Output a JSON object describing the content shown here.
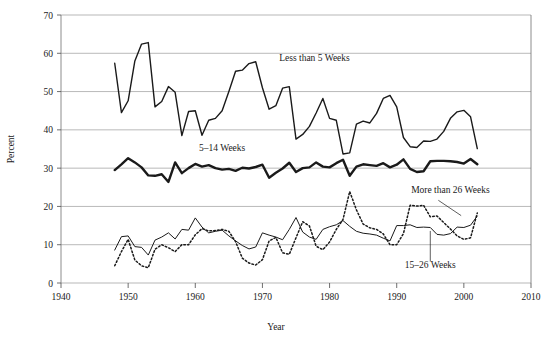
{
  "chart_data": {
    "type": "line",
    "title": "",
    "xlabel": "Year",
    "ylabel": "Percent",
    "xlim": [
      1940,
      2010
    ],
    "ylim": [
      0,
      70
    ],
    "xticks": [
      1940,
      1950,
      1960,
      1970,
      1980,
      1990,
      2000,
      2010
    ],
    "yticks": [
      0,
      10,
      20,
      30,
      40,
      50,
      60,
      70
    ],
    "grid": "horizontal",
    "legend": "inline-annotations",
    "x": [
      1948,
      1949,
      1950,
      1951,
      1952,
      1953,
      1954,
      1955,
      1956,
      1957,
      1958,
      1959,
      1960,
      1961,
      1962,
      1963,
      1964,
      1965,
      1966,
      1967,
      1968,
      1969,
      1970,
      1971,
      1972,
      1973,
      1974,
      1975,
      1976,
      1977,
      1978,
      1979,
      1980,
      1981,
      1982,
      1983,
      1984,
      1985,
      1986,
      1987,
      1988,
      1989,
      1990,
      1991,
      1992,
      1993,
      1994,
      1995,
      1996,
      1997,
      1998,
      1999,
      2000,
      2001,
      2002
    ],
    "series": [
      {
        "name": "Less than 5 Weeks",
        "style": "solid",
        "linewidth": 1.4,
        "color": "#1a1a1a",
        "values": [
          57.4,
          44.5,
          47.6,
          58.0,
          62.4,
          62.8,
          46.0,
          47.4,
          51.3,
          49.8,
          38.5,
          44.8,
          45.0,
          38.6,
          42.5,
          43.0,
          45.0,
          50.0,
          55.3,
          55.6,
          57.3,
          57.8,
          51.0,
          45.4,
          46.3,
          50.9,
          51.3,
          37.6,
          38.8,
          40.9,
          44.4,
          48.2,
          43.0,
          42.5,
          33.7,
          34.0,
          41.5,
          42.3,
          41.8,
          44.3,
          48.2,
          49.0,
          46.0,
          38.0,
          35.6,
          35.4,
          37.1,
          37.0,
          37.6,
          39.6,
          43.0,
          44.7,
          45.1,
          43.4,
          35.1
        ]
      },
      {
        "name": "5-14 Weeks",
        "style": "solid",
        "linewidth": 2.4,
        "color": "#1a1a1a",
        "values": [
          29.5,
          31.0,
          32.6,
          31.5,
          30.2,
          28.1,
          28.0,
          28.4,
          26.4,
          31.5,
          28.7,
          30.0,
          31.1,
          30.4,
          30.8,
          30.0,
          29.6,
          29.8,
          29.3,
          30.1,
          29.9,
          30.3,
          30.9,
          27.5,
          28.8,
          29.9,
          31.4,
          29.0,
          30.0,
          30.2,
          31.5,
          30.4,
          30.2,
          31.3,
          32.2,
          28.0,
          30.4,
          31.0,
          30.8,
          30.6,
          31.3,
          30.2,
          30.9,
          32.3,
          29.8,
          29.0,
          29.2,
          31.8,
          31.9,
          31.9,
          31.8,
          31.6,
          31.2,
          32.4,
          31.0
        ]
      },
      {
        "name": "15-26 Weeks",
        "style": "solid",
        "linewidth": 1.0,
        "color": "#1a1a1a",
        "values": [
          8.6,
          12.1,
          12.3,
          9.5,
          9.3,
          7.3,
          11.2,
          12.0,
          13.1,
          11.5,
          14.0,
          13.8,
          17.0,
          14.6,
          13.1,
          13.5,
          13.8,
          12.3,
          11.0,
          9.8,
          8.9,
          9.4,
          13.1,
          12.5,
          12.0,
          11.3,
          14.0,
          17.1,
          13.3,
          12.0,
          11.4,
          14.0,
          14.7,
          15.2,
          16.3,
          14.8,
          13.5,
          13.0,
          12.8,
          12.5,
          11.7,
          11.0,
          15.0,
          15.0,
          15.2,
          14.5,
          14.6,
          14.5,
          12.7,
          12.5,
          12.9,
          14.6,
          14.5,
          15.1,
          17.5
        ]
      },
      {
        "name": "More than 26 Weeks",
        "style": "dotted",
        "linewidth": 1.5,
        "color": "#1a1a1a",
        "values": [
          4.5,
          8.2,
          11.4,
          6.0,
          4.5,
          4.0,
          8.8,
          10.0,
          9.2,
          8.2,
          10.0,
          10.0,
          12.6,
          14.2,
          13.6,
          13.7,
          14.0,
          13.5,
          10.8,
          6.5,
          5.2,
          4.7,
          6.1,
          11.0,
          11.9,
          7.9,
          7.5,
          11.8,
          16.0,
          14.9,
          9.6,
          8.7,
          10.7,
          14.0,
          16.6,
          23.9,
          19.1,
          15.4,
          14.4,
          14.0,
          12.8,
          10.0,
          10.0,
          12.9,
          20.3,
          20.1,
          20.3,
          17.3,
          17.5,
          15.8,
          14.1,
          12.3,
          11.4,
          11.8,
          18.3
        ]
      }
    ],
    "annotations": [
      {
        "text": "Less than 5 Weeks",
        "x": 1972.5,
        "y": 58.0
      },
      {
        "text": "5-14 Weeks",
        "x": 1964.0,
        "y": 34.5
      },
      {
        "text": "More than 26 Weeks",
        "x": 1998.0,
        "y": 23.5
      },
      {
        "text": "15-26 Weeks",
        "x": 1995.0,
        "y": 4.0
      }
    ]
  },
  "axes": {
    "ylabel": "Percent",
    "xlabel": "Year",
    "ytick_labels": [
      "0",
      "10",
      "20",
      "30",
      "40",
      "50",
      "60",
      "70"
    ],
    "xtick_labels": [
      "1940",
      "1950",
      "1960",
      "1970",
      "1980",
      "1990",
      "2000",
      "2010"
    ]
  },
  "labels": {
    "less_than_5": "Less than 5 Weeks",
    "five_to_14": "5–14 Weeks",
    "more_than_26": "More than 26 Weeks",
    "fifteen_to_26": "15–26 Weeks"
  },
  "colors": {
    "line": "#1a1a1a",
    "grid": "#9a9a9a",
    "axis": "#6e6e6e",
    "background": "#ffffff"
  }
}
